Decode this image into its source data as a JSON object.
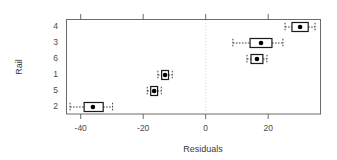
{
  "chart_data": {
    "type": "box",
    "title": "",
    "xlabel": "Residuals",
    "ylabel": "Rail",
    "xlim": [
      -43.5,
      37
    ],
    "xticks": [
      -40,
      -20,
      0,
      20
    ],
    "xtick_labels": [
      "-40",
      "-20",
      "0",
      "20"
    ],
    "ytick_labels": [
      "4",
      "3",
      "6",
      "1",
      "5",
      "2"
    ],
    "grid": false,
    "legend": "none",
    "reference_line": {
      "x": 0,
      "style": "dotted"
    },
    "categories": [
      "4",
      "3",
      "6",
      "1",
      "5",
      "2"
    ],
    "boxes": [
      {
        "category": "4",
        "lower_whisker": -18.5,
        "q1": -4.3,
        "median": 30.2,
        "q3": 32.8,
        "upper_whisker": 35.0,
        "whisker_min": 25.4,
        "whisker_max": 35.0,
        "box_left": 27.6,
        "box_right": 32.8
      },
      {
        "category": "3",
        "median": 17.7,
        "whisker_min": 8.7,
        "whisker_max": 24.7,
        "box_left": 14.2,
        "box_right": 21.2
      },
      {
        "category": "6",
        "median": 16.4,
        "whisker_min": 13.2,
        "whisker_max": 19.6,
        "box_left": 14.5,
        "box_right": 18.3
      },
      {
        "category": "1",
        "median": -13.0,
        "whisker_min": -15.3,
        "whisker_max": -10.7,
        "box_left": -14.1,
        "box_right": -11.9
      },
      {
        "category": "5",
        "median": -16.5,
        "whisker_min": -18.7,
        "whisker_max": -14.2,
        "box_left": -17.6,
        "box_right": -15.4
      },
      {
        "category": "2",
        "median": -36.1,
        "whisker_min": -43.4,
        "whisker_max": -29.8,
        "box_left": -38.9,
        "box_right": -32.8
      }
    ]
  },
  "colors": {
    "frame": "#6b6b6b",
    "box_stroke": "#1a1a1a",
    "median": "#000000",
    "reference_line": "#c9c9c9",
    "text": "#3a3a3a",
    "background": "#ffffff"
  }
}
